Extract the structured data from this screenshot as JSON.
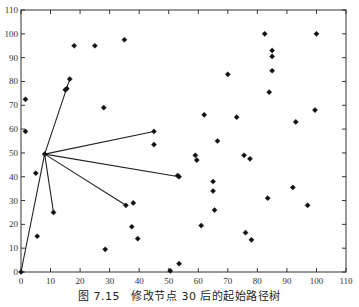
{
  "caption": "图 7.15　修改节点 30 后的起始路径树",
  "chart_data": {
    "type": "scatter",
    "title": "",
    "xlabel": "",
    "ylabel": "",
    "xlim": [
      0,
      110
    ],
    "ylim": [
      0,
      110
    ],
    "grid": false,
    "legend": null,
    "x_ticks": [
      0,
      10,
      20,
      30,
      40,
      50,
      60,
      70,
      80,
      90,
      100,
      110
    ],
    "y_ticks": [
      0,
      10,
      20,
      30,
      40,
      50,
      60,
      70,
      80,
      90,
      100,
      110
    ],
    "marker": "filled-diamond",
    "marker_color": "#111111",
    "line_color": "#222222",
    "points": [
      [
        0,
        0
      ],
      [
        1.5,
        72.5
      ],
      [
        1.5,
        59
      ],
      [
        5,
        41.5
      ],
      [
        5.5,
        15
      ],
      [
        8,
        49.5
      ],
      [
        11,
        25
      ],
      [
        15,
        76.5
      ],
      [
        15.5,
        77
      ],
      [
        16.5,
        81
      ],
      [
        18,
        95
      ],
      [
        25,
        95
      ],
      [
        28,
        69
      ],
      [
        28.5,
        9.5
      ],
      [
        35,
        97.5
      ],
      [
        35.5,
        28
      ],
      [
        37.5,
        19
      ],
      [
        38,
        29
      ],
      [
        39.5,
        14
      ],
      [
        45,
        59
      ],
      [
        45,
        53.5
      ],
      [
        50.5,
        0.5
      ],
      [
        53,
        40.5
      ],
      [
        53.5,
        40
      ],
      [
        53.5,
        3.5
      ],
      [
        59,
        49
      ],
      [
        59.5,
        47
      ],
      [
        61,
        19.5
      ],
      [
        62,
        66
      ],
      [
        65,
        38
      ],
      [
        65,
        34
      ],
      [
        65.5,
        26
      ],
      [
        66.5,
        55
      ],
      [
        70,
        83
      ],
      [
        73,
        65
      ],
      [
        75.5,
        49
      ],
      [
        76,
        16.5
      ],
      [
        77.5,
        47.5
      ],
      [
        78,
        13.5
      ],
      [
        82.5,
        100
      ],
      [
        83.5,
        31
      ],
      [
        84,
        75.5
      ],
      [
        85,
        93
      ],
      [
        85,
        90.5
      ],
      [
        85,
        84.5
      ],
      [
        92,
        35.5
      ],
      [
        93,
        63
      ],
      [
        97,
        28
      ],
      [
        99.5,
        68
      ],
      [
        100,
        100
      ]
    ],
    "tree_edges": [
      [
        [
          8,
          49.5
        ],
        [
          0,
          0
        ]
      ],
      [
        [
          8,
          49.5
        ],
        [
          16.5,
          81
        ]
      ],
      [
        [
          8,
          49.5
        ],
        [
          45,
          59
        ]
      ],
      [
        [
          8,
          49.5
        ],
        [
          53.5,
          40
        ]
      ],
      [
        [
          8,
          49.5
        ],
        [
          35.5,
          28
        ]
      ],
      [
        [
          8,
          49.5
        ],
        [
          11,
          25
        ]
      ]
    ],
    "annotations": []
  }
}
